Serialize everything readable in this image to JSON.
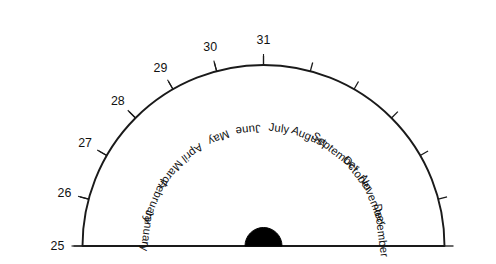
{
  "figure": {
    "type": "fan-diagram",
    "title": "",
    "background_color": "#ffffff",
    "line_color": "#1a1a1a",
    "hub_color": "#000000"
  },
  "chart_data": {
    "type": "pie",
    "title": "",
    "subtitle": "",
    "xlabel": "",
    "ylabel": "",
    "legend_position": "none",
    "grid": false,
    "orientation": "semicircle-180-degrees",
    "sweep_start_deg": 180,
    "sweep_end_deg": 0,
    "categories": [
      "January",
      "February",
      "March",
      "April",
      "May",
      "June",
      "July",
      "August",
      "September",
      "October",
      "November",
      "December"
    ],
    "values": [
      31,
      28,
      31,
      30,
      31,
      30,
      31,
      31,
      30,
      31,
      30,
      31
    ],
    "values_label": "days in month",
    "slice_angle_deg": 15,
    "scale_ticks": [
      25,
      26,
      27,
      28,
      29,
      30,
      31
    ],
    "scale_tick_label_side": "left",
    "annotations": []
  },
  "labels": {
    "months": [
      {
        "name": "January",
        "days": 31,
        "index": 0
      },
      {
        "name": "February",
        "days": 28,
        "index": 1
      },
      {
        "name": "March",
        "days": 31,
        "index": 2
      },
      {
        "name": "April",
        "days": 30,
        "index": 3
      },
      {
        "name": "May",
        "days": 31,
        "index": 4
      },
      {
        "name": "June",
        "days": 30,
        "index": 5
      },
      {
        "name": "July",
        "days": 31,
        "index": 6
      },
      {
        "name": "August",
        "days": 31,
        "index": 7
      },
      {
        "name": "September",
        "days": 30,
        "index": 8
      },
      {
        "name": "October",
        "days": 31,
        "index": 9
      },
      {
        "name": "November",
        "days": 30,
        "index": 10
      },
      {
        "name": "December",
        "days": 31,
        "index": 11
      }
    ],
    "scale": [
      {
        "value": "25"
      },
      {
        "value": "26"
      },
      {
        "value": "27"
      },
      {
        "value": "28"
      },
      {
        "value": "29"
      },
      {
        "value": "30"
      },
      {
        "value": "31"
      }
    ]
  }
}
